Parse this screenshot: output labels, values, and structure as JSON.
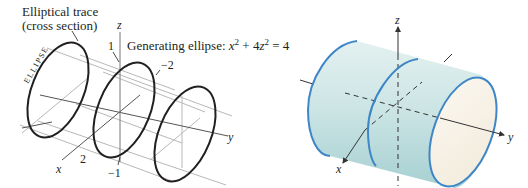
{
  "left_panel": {
    "title_line1": "Elliptical trace",
    "title_line2": "(cross section)",
    "side_label": "ELLIPSE",
    "generating_label": "Generating ellipse: ",
    "equation": {
      "x_var": "x",
      "x_exp": "2",
      "plus": " + 4",
      "z_var": "z",
      "z_exp": "2",
      "equals": " = 4"
    },
    "axes": {
      "x": "x",
      "y": "y",
      "z": "z"
    },
    "ticks": {
      "z_pos": "1",
      "z_neg": "−1",
      "x_pos": "2",
      "x_neg": "−2"
    },
    "colors": {
      "ellipse_stroke": "#231f20",
      "grid_stroke": "#b8b8b8",
      "axis_stroke": "#555555"
    }
  },
  "right_panel": {
    "axes": {
      "x": "x",
      "y": "y",
      "z": "z"
    },
    "colors": {
      "surface_fill": "#cfe6e6",
      "surface_shade": "#a9d3d4",
      "inner_fill": "#f8f3ea",
      "edge_stroke": "#3f86c6",
      "axis_stroke": "#333333"
    }
  }
}
